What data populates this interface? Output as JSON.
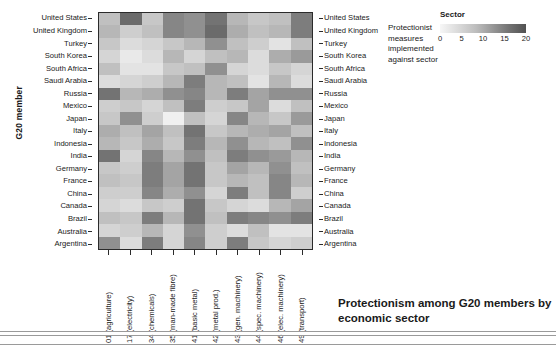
{
  "figure": {
    "title": "Protectionism among G20 members by economic sector",
    "y_axis_title": "G20 member"
  },
  "legend": {
    "title": "Sector",
    "description": "Protectionist measures implemented against sector",
    "ticks": [
      "0",
      "5",
      "10",
      "15",
      "20"
    ],
    "tick_values": [
      0,
      5,
      10,
      15,
      20
    ],
    "gradient_low_color": "#f7f7f7",
    "gradient_high_color": "#525252"
  },
  "chart_data": {
    "type": "heatmap",
    "title": "Protectionism among G20 members by economic sector",
    "xlabel": "",
    "ylabel": "G20 member",
    "colorbar_label": "Protectionist measures implemented against sector",
    "colorbar_title": "Sector",
    "zlim": [
      0,
      20
    ],
    "grid": false,
    "legend_position": "top-right",
    "categories_x": [
      "01 (agriculture)",
      "17 (electricity)",
      "34 (chemicals)",
      "35 (man-made fibre)",
      "41 (basic metal)",
      "42 (metal prod.)",
      "43 (gen. machinery)",
      "44 (spec. machinery)",
      "46 (elec. machinery)",
      "49 (transport)"
    ],
    "categories_y": [
      "United States",
      "United Kingdom",
      "Turkey",
      "South Korea",
      "South Africa",
      "Saudi Arabia",
      "Russia",
      "Mexico",
      "Japan",
      "Italy",
      "Indonesia",
      "India",
      "Germany",
      "France",
      "China",
      "Canada",
      "Brazil",
      "Australia",
      "Argentina"
    ],
    "values": [
      [
        8,
        17,
        7,
        14,
        13,
        16,
        9,
        7,
        8,
        15
      ],
      [
        9,
        6,
        8,
        14,
        13,
        17,
        10,
        8,
        9,
        15
      ],
      [
        7,
        4,
        5,
        7,
        9,
        13,
        8,
        6,
        3,
        8
      ],
      [
        5,
        2,
        4,
        9,
        5,
        8,
        9,
        4,
        10,
        12
      ],
      [
        8,
        3,
        3,
        7,
        8,
        13,
        5,
        4,
        7,
        5
      ],
      [
        4,
        5,
        6,
        9,
        15,
        9,
        8,
        3,
        9,
        4
      ],
      [
        16,
        9,
        10,
        13,
        14,
        9,
        15,
        11,
        13,
        13
      ],
      [
        6,
        7,
        5,
        8,
        15,
        6,
        7,
        11,
        4,
        8
      ],
      [
        7,
        13,
        6,
        1,
        8,
        5,
        14,
        9,
        7,
        12
      ],
      [
        10,
        8,
        11,
        8,
        16,
        7,
        9,
        10,
        11,
        8
      ],
      [
        9,
        7,
        10,
        7,
        15,
        9,
        13,
        9,
        8,
        13
      ],
      [
        16,
        5,
        14,
        9,
        13,
        8,
        15,
        13,
        12,
        9
      ],
      [
        7,
        6,
        15,
        11,
        16,
        7,
        11,
        9,
        13,
        8
      ],
      [
        8,
        7,
        15,
        11,
        16,
        7,
        9,
        8,
        14,
        9
      ],
      [
        6,
        6,
        14,
        10,
        13,
        5,
        15,
        8,
        14,
        6
      ],
      [
        5,
        4,
        7,
        6,
        16,
        7,
        5,
        4,
        9,
        11
      ],
      [
        8,
        7,
        15,
        9,
        16,
        8,
        15,
        14,
        13,
        15
      ],
      [
        5,
        6,
        9,
        5,
        13,
        6,
        4,
        8,
        3,
        3
      ],
      [
        13,
        4,
        15,
        5,
        14,
        6,
        15,
        7,
        5,
        6
      ]
    ]
  }
}
